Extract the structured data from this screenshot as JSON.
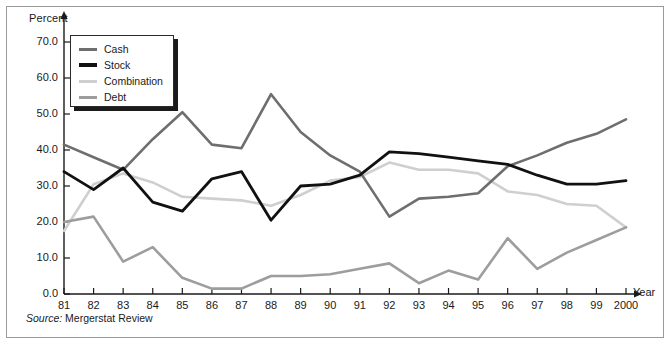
{
  "figure": {
    "source_lead": "Source:",
    "source_text": "Mergerstat Review"
  },
  "legend": {
    "items": [
      {
        "label": "Cash",
        "color": "#6e6e6e"
      },
      {
        "label": "Stock",
        "color": "#111111"
      },
      {
        "label": "Combination",
        "color": "#cfcfcf"
      },
      {
        "label": "Debt",
        "color": "#9d9d9d"
      }
    ]
  },
  "chart_data": {
    "type": "line",
    "title": "",
    "xlabel": "Year",
    "ylabel": "Percent",
    "xlim": [
      0,
      19
    ],
    "ylim": [
      0,
      75
    ],
    "ytick_step": 10,
    "grid": false,
    "legend_position": "top-left",
    "categories": [
      "81",
      "82",
      "83",
      "84",
      "85",
      "86",
      "87",
      "88",
      "89",
      "90",
      "91",
      "92",
      "93",
      "94",
      "95",
      "96",
      "97",
      "98",
      "99",
      "2000"
    ],
    "yticks": [
      "0.0",
      "10.0",
      "20.0",
      "30.0",
      "40.0",
      "50.0",
      "60.0",
      "70.0"
    ],
    "series": [
      {
        "name": "Cash",
        "color": "#6e6e6e",
        "width": 2.6,
        "values": [
          41.5,
          38.0,
          34.5,
          43.0,
          50.5,
          41.5,
          40.5,
          55.5,
          45.0,
          38.5,
          34.0,
          21.5,
          26.5,
          27.0,
          28.0,
          35.5,
          38.5,
          42.0,
          44.5,
          48.5
        ]
      },
      {
        "name": "Stock",
        "color": "#111111",
        "width": 2.8,
        "values": [
          34.0,
          29.0,
          35.0,
          25.5,
          23.0,
          32.0,
          34.0,
          20.5,
          30.0,
          30.5,
          33.0,
          39.5,
          39.0,
          38.0,
          37.0,
          36.0,
          33.0,
          30.5,
          30.5,
          31.5
        ]
      },
      {
        "name": "Combination",
        "color": "#cfcfcf",
        "width": 2.6,
        "values": [
          17.5,
          30.5,
          33.5,
          31.0,
          27.0,
          26.5,
          26.0,
          24.5,
          27.5,
          31.5,
          32.5,
          36.5,
          34.5,
          34.5,
          33.5,
          28.5,
          27.5,
          25.0,
          24.5,
          18.5
        ]
      },
      {
        "name": "Debt",
        "color": "#9d9d9d",
        "width": 2.6,
        "values": [
          20.0,
          21.5,
          9.0,
          13.0,
          4.5,
          1.5,
          1.5,
          5.0,
          5.0,
          5.5,
          7.0,
          8.5,
          3.0,
          6.5,
          4.0,
          15.5,
          7.0,
          11.5,
          15.0,
          18.5
        ]
      }
    ]
  }
}
